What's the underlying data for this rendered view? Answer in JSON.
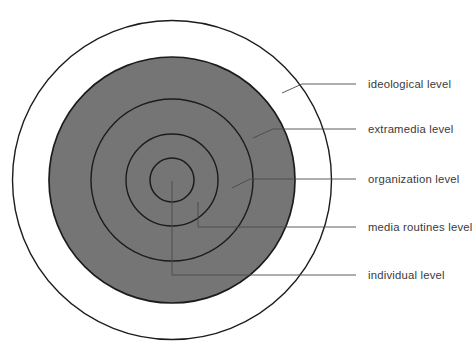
{
  "diagram": {
    "type": "concentric-circles",
    "name": "hierarchy of influences model",
    "levels": [
      {
        "order": 1,
        "ring": "outermost",
        "label": "ideological level",
        "fill": "#ffffff"
      },
      {
        "order": 2,
        "ring": "ring-2",
        "label": "extramedia level",
        "fill": "#757575"
      },
      {
        "order": 3,
        "ring": "ring-3",
        "label": "organization level",
        "fill": "#757575"
      },
      {
        "order": 4,
        "ring": "ring-4",
        "label": "media routines level",
        "fill": "#757575"
      },
      {
        "order": 5,
        "ring": "innermost",
        "label": "individual level",
        "fill": "#757575"
      }
    ],
    "colors": {
      "background": "#ffffff",
      "shaded_fill": "#757575",
      "circle_stroke": "#1c1c1c",
      "leader_line": "#4a4a4a",
      "label_text": "#3a3a3a"
    }
  }
}
